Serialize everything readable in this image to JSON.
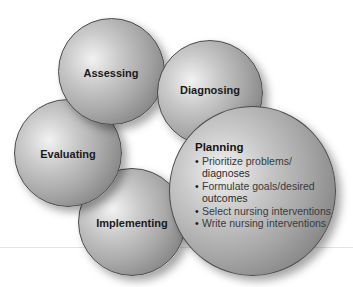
{
  "diagram": {
    "type": "nursing-process-cycle",
    "stages": [
      {
        "id": "assessing",
        "label": "Assessing"
      },
      {
        "id": "diagnosing",
        "label": "Diagnosing"
      },
      {
        "id": "planning",
        "label": "Planning",
        "items": [
          "Prioritize problems/",
          "diagnoses",
          "Formulate goals/desired",
          "outcomes",
          "Select nursing interventions",
          "Write nursing interventions"
        ],
        "bullets": [
          "Prioritize problems/ diagnoses",
          "Formulate goals/desired outcomes",
          "Select nursing interventions",
          "Write nursing interventions"
        ]
      },
      {
        "id": "implementing",
        "label": "Implementing"
      },
      {
        "id": "evaluating",
        "label": "Evaluating"
      }
    ],
    "colors": {
      "sphere_light": "#f2f2f2",
      "sphere_dark": "#6a6a6a",
      "outline": "#4a4a4a",
      "text": "#1a1a1a"
    }
  }
}
